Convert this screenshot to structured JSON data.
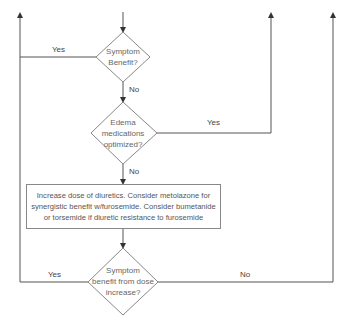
{
  "diagram": {
    "type": "flowchart",
    "nodes": {
      "decision1": {
        "line1": "Symptom",
        "line2": "Benefit?"
      },
      "decision2": {
        "line1": "Edema",
        "line2": "medications",
        "line3": "optimized?"
      },
      "process1": {
        "line1": "Increase dose of diuretics. Consider metolazone for",
        "line2": "synergistic benefit w/furosemide. Consider bumetanide",
        "line3": "or torsemide if diuretic resistance to furosemide"
      },
      "decision3": {
        "line1": "Symptom",
        "line2": "benefit from dose",
        "line3": "increase?"
      }
    },
    "edge_labels": {
      "d1_yes": "Yes",
      "d1_no": "No",
      "d2_yes": "Yes",
      "d2_no": "No",
      "d3_yes": "Yes",
      "d3_no": "No"
    },
    "colors": {
      "line": "#555555",
      "shape_border": "#888888",
      "text": "#555555",
      "background": "#ffffff"
    }
  }
}
